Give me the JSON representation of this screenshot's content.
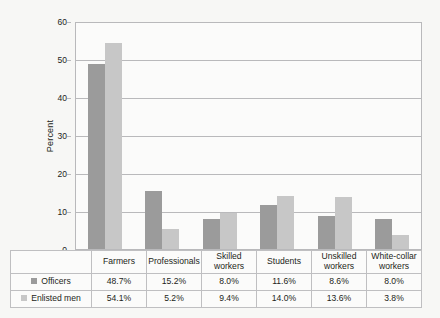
{
  "chart_data": {
    "type": "bar",
    "title": "",
    "xlabel": "",
    "ylabel": "Percent",
    "ylim": [
      0,
      60
    ],
    "yticks": [
      0,
      10,
      20,
      30,
      40,
      50,
      60
    ],
    "grid": true,
    "legend_position": "table-below",
    "categories": [
      "Farmers",
      "Professionals",
      "Skilled workers",
      "Students",
      "Unskilled workers",
      "White-collar workers"
    ],
    "category_lines": [
      [
        "Farmers"
      ],
      [
        "Professionals"
      ],
      [
        "Skilled",
        "workers"
      ],
      [
        "Students"
      ],
      [
        "Unskilled",
        "workers"
      ],
      [
        "White-collar",
        "workers"
      ]
    ],
    "series": [
      {
        "name": "Officers",
        "color": "#9b9b9b",
        "values": [
          48.7,
          15.2,
          8.0,
          11.6,
          8.6,
          8.0
        ],
        "labels": [
          "48.7%",
          "15.2%",
          "8.0%",
          "11.6%",
          "8.6%",
          "8.0%"
        ]
      },
      {
        "name": "Enlisted men",
        "color": "#c7c7c7",
        "values": [
          54.1,
          5.2,
          9.4,
          14.0,
          13.6,
          3.8
        ],
        "labels": [
          "54.1%",
          "5.2%",
          "9.4%",
          "14.0%",
          "13.6%",
          "3.8%"
        ]
      }
    ]
  },
  "colors": {
    "series_officers": "#9b9b9b",
    "series_enlisted": "#c7c7c7",
    "grid": "#b9b9bb",
    "frame": "#b9b9bb",
    "background": "#f7f7f5",
    "plot_background": "#fbfbfa",
    "text": "#231f20"
  }
}
